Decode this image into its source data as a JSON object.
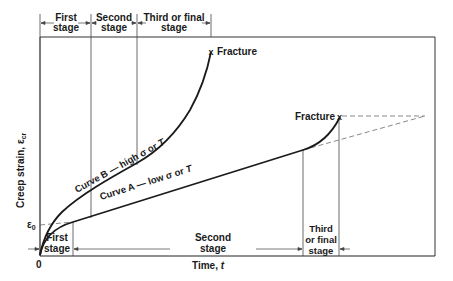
{
  "diagram": {
    "y_axis_label": "Creep strain, ε",
    "y_axis_subscript": "cr",
    "x_axis_label": "Time, ",
    "x_axis_symbol": "t",
    "origin_label": "0",
    "epsilon0_label": "ε",
    "epsilon0_subscript": "0",
    "top_stages": [
      {
        "line1": "First",
        "line2": "stage"
      },
      {
        "line1": "Second",
        "line2": "stage"
      },
      {
        "line1": "Third or final",
        "line2": "stage"
      }
    ],
    "bottom_stages": [
      {
        "line1": "First",
        "line2": "stage"
      },
      {
        "line1": "Second",
        "line2": "stage"
      },
      {
        "line1": "Third",
        "line2": "or final",
        "line3": "stage"
      }
    ],
    "curve_b": {
      "label": "Curve B — high σ or ",
      "symbol": "T",
      "fracture_label": "Fracture"
    },
    "curve_a": {
      "label": "Curve A — low σ or ",
      "symbol": "T",
      "fracture_label": "Fracture"
    },
    "fracture_marker": "x"
  },
  "colors": {
    "ink": "#1a1a1a",
    "thin": "#444444",
    "background": "#ffffff"
  }
}
